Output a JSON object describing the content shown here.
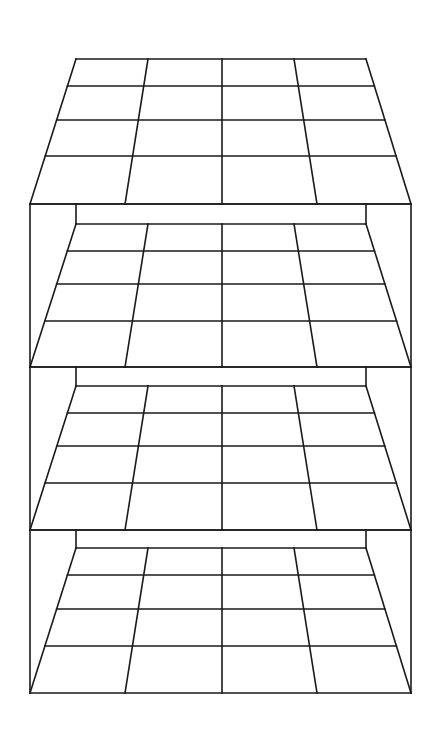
{
  "figure": {
    "stroke_color": "#1a1a1a",
    "background": "#ffffff",
    "outer_left_x": 30,
    "outer_right_x": 411,
    "back_left_x": 76,
    "back_right_x": 366,
    "top_plane": {
      "back_y": 59,
      "front_y": 204,
      "row_ys": [
        86,
        120,
        156
      ]
    },
    "levels": [
      {
        "top_y": 204,
        "back_y": 224,
        "row_ys": [
          251,
          284,
          321
        ],
        "front_y": 367
      },
      {
        "top_y": 367,
        "back_y": 386,
        "row_ys": [
          413,
          446,
          483
        ],
        "front_y": 530
      },
      {
        "top_y": 530,
        "back_y": 548,
        "row_ys": [
          575,
          609,
          646
        ],
        "front_y": 693
      }
    ],
    "columns": {
      "back_xs": [
        76,
        148,
        222,
        294,
        366
      ],
      "front_xs": [
        30,
        125,
        222,
        317,
        411
      ]
    }
  }
}
